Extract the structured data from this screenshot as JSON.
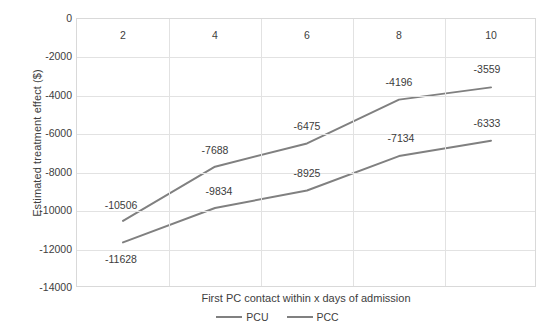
{
  "chart_data": {
    "type": "line",
    "title": "",
    "xlabel": "First PC contact within x days of admission",
    "ylabel": "Estimated treatment effect ($)",
    "categories": [
      "2",
      "4",
      "6",
      "8",
      "10"
    ],
    "x_tick_labels": [
      "2",
      "4",
      "6",
      "8",
      "10"
    ],
    "y_tick_labels": [
      "0",
      "-2000",
      "-4000",
      "-6000",
      "-8000",
      "-10000",
      "-12000",
      "-14000"
    ],
    "y_tick_values": [
      0,
      -2000,
      -4000,
      -6000,
      -8000,
      -10000,
      -12000,
      -14000
    ],
    "ylim": [
      -14000,
      0
    ],
    "grid": true,
    "legend_position": "bottom",
    "series": [
      {
        "name": "PCU",
        "color": "#808080",
        "values": [
          -10506,
          -7688,
          -6475,
          -4196,
          -3559
        ],
        "data_labels": [
          "-10506",
          "-7688",
          "-6475",
          "-4196",
          "-3559"
        ]
      },
      {
        "name": "PCC",
        "color": "#808080",
        "values": [
          -11628,
          -9834,
          -8925,
          -7134,
          -6333
        ],
        "data_labels": [
          "-11628",
          "-9834",
          "-8925",
          "-7134",
          "-6333"
        ]
      }
    ]
  },
  "legend": {
    "items": [
      {
        "label": "PCU"
      },
      {
        "label": "PCC"
      }
    ]
  }
}
